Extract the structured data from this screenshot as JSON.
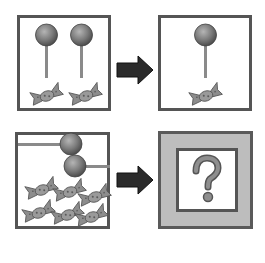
{
  "rows": [
    {
      "left": {
        "lollipops": 2,
        "candies": 2,
        "lollipop_orientation": "vertical"
      },
      "arrow": "right-arrow",
      "right": {
        "lollipops": 1,
        "candies": 1,
        "lollipop_orientation": "vertical"
      }
    },
    {
      "left": {
        "lollipops": 2,
        "candies": 6,
        "lollipop_orientation": "horizontal"
      },
      "arrow": "right-arrow",
      "right": {
        "unknown": true,
        "symbol": "?"
      }
    }
  ],
  "question_mark": "?",
  "colors": {
    "lollipop": "#7a7a7a",
    "candy": "#8c8c8c",
    "border": "#555555",
    "answer_panel_bg": "#bdbdbd",
    "arrow": "#2b2b2b"
  }
}
